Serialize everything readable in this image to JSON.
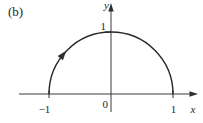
{
  "figure": {
    "panel_label": "(b)",
    "x_axis": {
      "label": "x",
      "tick_labels": [
        "−1",
        "1"
      ]
    },
    "y_axis": {
      "label": "y",
      "tick_labels": [
        "1"
      ]
    },
    "origin_label": "0",
    "curve": {
      "type": "semicircle",
      "half": "upper",
      "center": [
        0,
        0
      ],
      "radius": 1,
      "endpoints": [
        [
          -1,
          0
        ],
        [
          1,
          0
        ]
      ],
      "direction_arrow": "on upper-left of arc, pointing up-right (travel from (−1,0) toward (0,1))"
    },
    "colors": {
      "line": "#2e2e2e",
      "background": "#ffffff"
    }
  }
}
